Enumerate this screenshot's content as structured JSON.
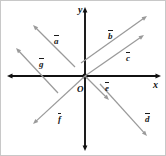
{
  "figure": {
    "kind": "vector-diagram",
    "width": 166,
    "height": 156,
    "background_color": "#ffffff",
    "border_color": "#c8c8c8"
  },
  "axes": {
    "color": "#111111",
    "origin": {
      "x": 84,
      "y": 75
    },
    "x_axis": {
      "label": "x",
      "label_x": 152,
      "label_y": 79,
      "from_x": 6,
      "from_y": 75,
      "to_x": 160,
      "to_y": 75,
      "double_headed": true
    },
    "y_axis": {
      "label": "y",
      "label_x": 77,
      "label_y": 4,
      "from_x": 84,
      "from_y": 150,
      "to_x": 84,
      "to_y": 6,
      "double_headed": true
    },
    "origin_label": {
      "text": "O",
      "label_x": 76,
      "label_y": 84
    }
  },
  "vectors": [
    {
      "id": "a",
      "label": "a",
      "color": "#9a9a9a",
      "tail_x": 74,
      "tail_y": 66,
      "tip_x": 32,
      "tip_y": 24,
      "label_x": 53,
      "label_y": 34,
      "quadrant": "upper-left",
      "direction": "up-left"
    },
    {
      "id": "b",
      "label": "b",
      "color": "#9a9a9a",
      "tail_x": 80,
      "tail_y": 62,
      "tip_x": 146,
      "tip_y": 15,
      "label_x": 107,
      "label_y": 29,
      "quadrant": "upper-right",
      "direction": "up-right"
    },
    {
      "id": "c",
      "label": "c",
      "color": "#9a9a9a",
      "tail_x": 84,
      "tail_y": 75,
      "tip_x": 143,
      "tip_y": 34,
      "label_x": 125,
      "label_y": 51,
      "quadrant": "upper-right",
      "direction": "up-right"
    },
    {
      "id": "d",
      "label": "d",
      "color": "#9a9a9a",
      "tail_x": 99,
      "tail_y": 83,
      "tip_x": 146,
      "tip_y": 135,
      "label_x": 144,
      "label_y": 112,
      "quadrant": "lower-right",
      "direction": "down-right"
    },
    {
      "id": "e",
      "label": "e",
      "color": "#9a9a9a",
      "tail_x": 84,
      "tail_y": 75,
      "tip_x": 108,
      "tip_y": 99,
      "label_x": 104,
      "label_y": 81,
      "quadrant": "lower-right",
      "direction": "down-right"
    },
    {
      "id": "f",
      "label": "f",
      "color": "#9a9a9a",
      "tail_x": 84,
      "tail_y": 75,
      "tip_x": 32,
      "tip_y": 123,
      "label_x": 57,
      "label_y": 112,
      "quadrant": "lower-left",
      "direction": "down-left"
    },
    {
      "id": "g",
      "label": "g",
      "color": "#9a9a9a",
      "tail_x": 57,
      "tail_y": 92,
      "tip_x": 15,
      "tip_y": 47,
      "label_x": 38,
      "label_y": 57,
      "quadrant": "upper-left",
      "direction": "up-left"
    }
  ]
}
